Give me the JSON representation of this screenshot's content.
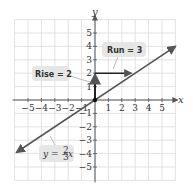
{
  "chart_data": {
    "type": "line",
    "title": "",
    "xlabel": "x",
    "ylabel": "y",
    "xlim": [
      -6,
      6
    ],
    "ylim": [
      -6,
      6
    ],
    "grid": true,
    "x_ticks": [
      -5,
      -4,
      -3,
      -2,
      -1,
      1,
      2,
      3,
      4,
      5
    ],
    "y_ticks": [
      -5,
      -4,
      -3,
      -2,
      -1,
      1,
      2,
      3,
      4,
      5
    ],
    "x_tick_labels": [
      "−5",
      "−4",
      "−3",
      "−2",
      "−1",
      "1",
      "2",
      "3",
      "4",
      "5"
    ],
    "y_tick_labels": [
      "−5",
      "−4",
      "−3",
      "−2",
      "−1",
      "1",
      "2",
      "3",
      "4",
      "5"
    ],
    "series": [
      {
        "name": "y = (2/3)x",
        "slope": 0.6667,
        "intercept": 0,
        "x": [
          -5.85,
          6
        ],
        "y": [
          -3.9,
          4
        ],
        "arrows_both_ends": true
      }
    ],
    "annotations": [
      {
        "type": "arrow",
        "label": "Rise = 2",
        "from": [
          0,
          0
        ],
        "to": [
          0,
          1.9
        ],
        "direction": "up"
      },
      {
        "type": "arrow",
        "label": "Run = 3",
        "from": [
          0,
          2
        ],
        "to": [
          2.7,
          2
        ],
        "direction": "right"
      },
      {
        "type": "point",
        "at": [
          0,
          0
        ]
      },
      {
        "type": "label",
        "text": "y = (2/3)x",
        "position": [
          -4.2,
          -4.1
        ]
      }
    ],
    "legend": null
  },
  "labels": {
    "x_axis": "x",
    "y_axis": "y",
    "rise": "Rise = 2",
    "run": "Run = 3",
    "equation_lhs": "y =",
    "equation_num": "2",
    "equation_den": "3",
    "equation_var": "x"
  },
  "colors": {
    "grid": "#dcdcdc",
    "axis": "#555555",
    "line": "#555555",
    "callout_bg": "#e6e6e6",
    "text": "#333333"
  }
}
